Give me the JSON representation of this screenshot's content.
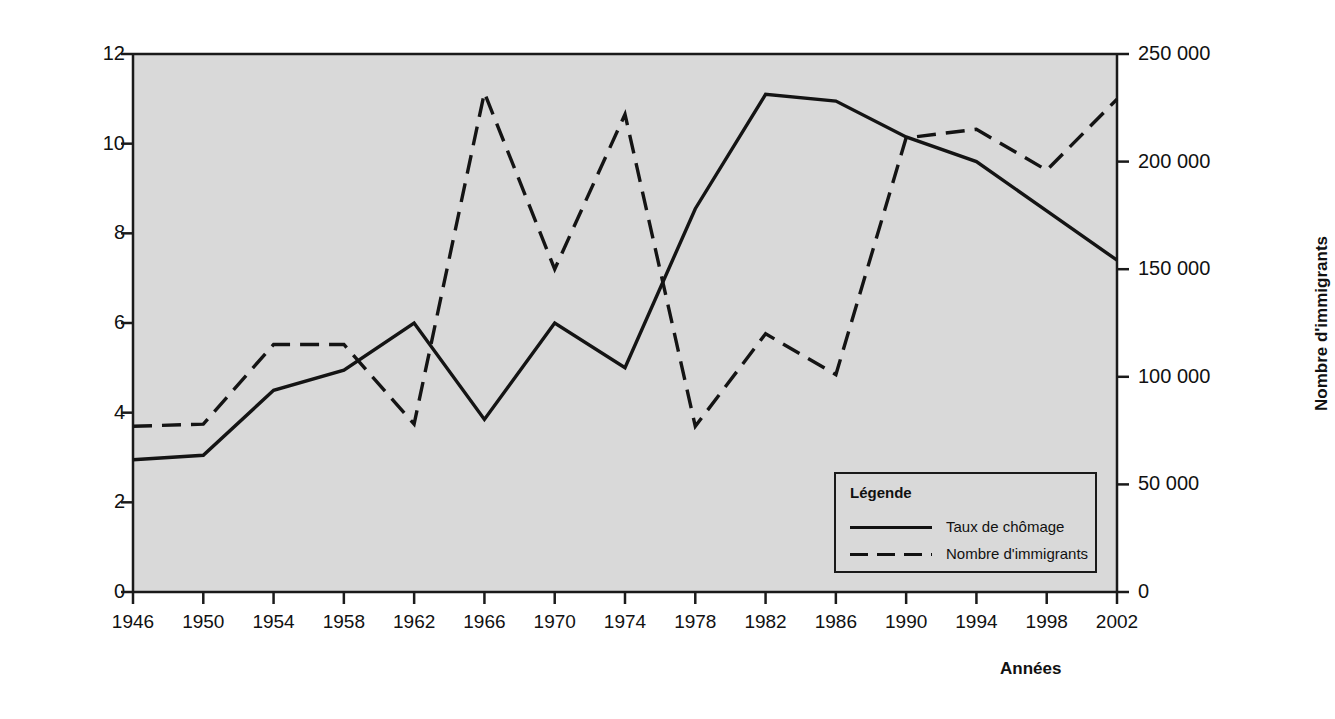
{
  "chart_data": {
    "type": "line",
    "title": "",
    "xlabel": "Années",
    "ylabel": "Taux de chômage (%)",
    "ylabel_right": "Nombre d'immigrants",
    "categories": [
      "1946",
      "1950",
      "1954",
      "1958",
      "1962",
      "1966",
      "1970",
      "1974",
      "1978",
      "1982",
      "1986",
      "1990",
      "1994",
      "1998",
      "2002"
    ],
    "x": [
      1946,
      1950,
      1954,
      1958,
      1962,
      1966,
      1970,
      1974,
      1978,
      1982,
      1986,
      1990,
      1994,
      1998,
      2002
    ],
    "ylim": [
      0,
      12
    ],
    "ylim_right": [
      0,
      250000
    ],
    "yticks": [
      "0",
      "2",
      "4",
      "6",
      "8",
      "10",
      "12"
    ],
    "ytick_values": [
      0,
      2,
      4,
      6,
      8,
      10,
      12
    ],
    "yticks_right": [
      "0",
      "50 000",
      "100 000",
      "150 000",
      "200 000",
      "250 000"
    ],
    "ytick_values_right": [
      0,
      50000,
      100000,
      150000,
      200000,
      250000
    ],
    "grid": false,
    "legend_position": "inside-bottom-right",
    "series": [
      {
        "name": "Taux de chômage",
        "axis": "left",
        "style": "solid",
        "values": [
          2.95,
          3.05,
          4.5,
          4.95,
          6.0,
          3.85,
          6.0,
          5.0,
          8.55,
          11.1,
          10.95,
          10.15,
          9.6,
          8.5,
          7.4
        ]
      },
      {
        "name": "Nombre d'immigrants",
        "axis": "right",
        "style": "dashed",
        "values": [
          77000,
          78000,
          115000,
          115000,
          78000,
          232000,
          150000,
          222000,
          77000,
          120000,
          101000,
          211000,
          215000,
          196000,
          229000
        ]
      }
    ]
  },
  "legend": {
    "title": "Légende",
    "entries": [
      {
        "label": "Taux de chômage",
        "style": "solid"
      },
      {
        "label": "Nombre d'immigrants",
        "style": "dashed"
      }
    ]
  },
  "colors": {
    "plot_background": "#d9d9d9",
    "line": "#141414",
    "axis": "#1a1a1a",
    "page_background": "#ffffff"
  }
}
